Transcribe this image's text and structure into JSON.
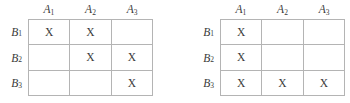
{
  "figure": {
    "mark": "X",
    "grid_color": "#b4b4b4",
    "text_color": "#3a3a3a",
    "background": "#ffffff"
  },
  "tables": [
    {
      "id": "left",
      "column_headers": [
        {
          "base": "A",
          "sub": "1"
        },
        {
          "base": "A",
          "sub": "2"
        },
        {
          "base": "A",
          "sub": "3"
        }
      ],
      "row_headers": [
        {
          "base": "B",
          "sub": "1"
        },
        {
          "base": "B",
          "sub": "2"
        },
        {
          "base": "B",
          "sub": "3"
        }
      ],
      "cells": [
        [
          "X",
          "X",
          ""
        ],
        [
          "",
          "X",
          "X"
        ],
        [
          "",
          "",
          "X"
        ]
      ]
    },
    {
      "id": "right",
      "column_headers": [
        {
          "base": "A",
          "sub": "1"
        },
        {
          "base": "A",
          "sub": "2"
        },
        {
          "base": "A",
          "sub": "3"
        }
      ],
      "row_headers": [
        {
          "base": "B",
          "sub": "1"
        },
        {
          "base": "B",
          "sub": "2"
        },
        {
          "base": "B",
          "sub": "3"
        }
      ],
      "cells": [
        [
          "X",
          "",
          ""
        ],
        [
          "X",
          "",
          ""
        ],
        [
          "X",
          "X",
          "X"
        ]
      ]
    }
  ]
}
